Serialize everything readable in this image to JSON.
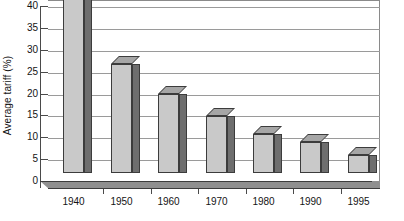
{
  "chart_data": {
    "type": "bar",
    "title": "",
    "subtitle": "",
    "xlabel": "",
    "ylabel": "Average tariff (%)",
    "categories": [
      "1940",
      "1950",
      "1960",
      "1970",
      "1980",
      "1990",
      "1995"
    ],
    "values": [
      40,
      25,
      18,
      13,
      9,
      7,
      4
    ],
    "series": [
      {
        "name": "Average tariff",
        "values": [
          40,
          25,
          18,
          13,
          9,
          7,
          4
        ]
      }
    ],
    "ylim": [
      0,
      40
    ],
    "ytick_step": 5,
    "yticks": [
      0,
      5,
      10,
      15,
      20,
      25,
      30,
      35,
      40
    ],
    "ytick_labels": [
      "0",
      "5",
      "10",
      "15",
      "20",
      "25",
      "30",
      "35",
      "40"
    ],
    "grid": "horizontal",
    "legend": "none",
    "style": "3d-column",
    "annotations": [],
    "colors": {
      "bar_face": "#c9c9c9",
      "bar_side": "#6e6e6e",
      "bar_top": "#a6a6a6",
      "bar_outline": "#3c3c3c",
      "gridline": "#9a9a9a",
      "axis": "#4a4a4a",
      "plot_border": "#8a8a8a",
      "floor": "#8f8f8f",
      "text": "#141414",
      "background": "#ffffff"
    }
  }
}
